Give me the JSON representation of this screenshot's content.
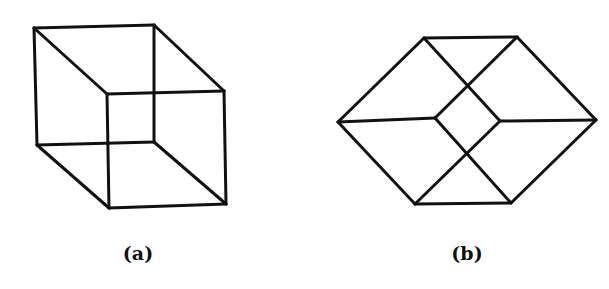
{
  "figure": {
    "stroke_color": "#111111",
    "background": "#ffffff",
    "panels": [
      {
        "id": "a",
        "label": "(a)",
        "description": "Necker cube wireframe in oblique view",
        "label_pos": [
          138,
          242
        ],
        "edges": [
          [
            34,
            28,
            154,
            25
          ],
          [
            154,
            25,
            154,
            142
          ],
          [
            154,
            142,
            37,
            145
          ],
          [
            37,
            145,
            34,
            28
          ],
          [
            107,
            94,
            224,
            91
          ],
          [
            224,
            91,
            226,
            204
          ],
          [
            226,
            204,
            109,
            208
          ],
          [
            109,
            208,
            107,
            94
          ],
          [
            34,
            28,
            107,
            94
          ],
          [
            154,
            25,
            224,
            91
          ],
          [
            37,
            145,
            109,
            208
          ],
          [
            154,
            142,
            226,
            204
          ]
        ]
      },
      {
        "id": "b",
        "label": "(b)",
        "description": "Cube wireframe viewed along body diagonal (hexagonal projection)",
        "label_pos": [
          467,
          242
        ],
        "edges": [
          [
            424,
            38,
            517,
            37
          ],
          [
            424,
            38,
            338,
            122
          ],
          [
            517,
            37,
            596,
            120
          ],
          [
            338,
            122,
            415,
            204
          ],
          [
            596,
            120,
            511,
            203
          ],
          [
            415,
            204,
            511,
            203
          ],
          [
            338,
            122,
            435,
            118
          ],
          [
            500,
            121,
            596,
            120
          ],
          [
            424,
            38,
            500,
            121
          ],
          [
            517,
            37,
            435,
            118
          ],
          [
            435,
            118,
            511,
            203
          ],
          [
            500,
            121,
            415,
            204
          ]
        ]
      }
    ]
  }
}
